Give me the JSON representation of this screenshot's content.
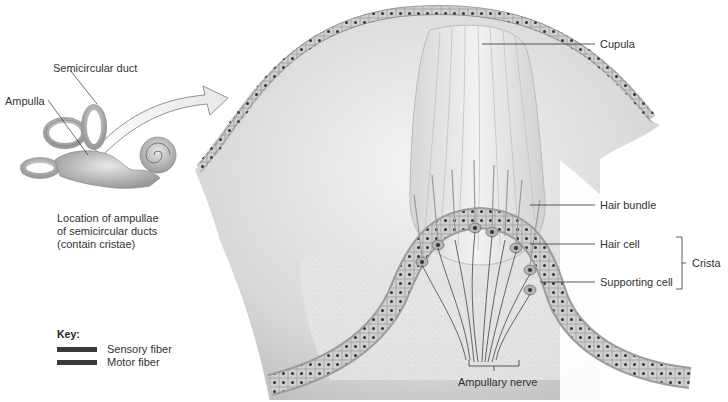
{
  "figure": {
    "inset": {
      "labels": {
        "semicircular_duct": "Semicircular duct",
        "ampulla": "Ampulla"
      },
      "caption_lines": [
        "Location of ampullae",
        "of semicircular ducts",
        "(contain cristae)"
      ]
    },
    "main": {
      "labels": {
        "cupula": "Cupula",
        "hair_bundle": "Hair bundle",
        "hair_cell": "Hair cell",
        "supporting_cell": "Supporting cell",
        "crista": "Crista",
        "ampullary_nerve": "Ampullary nerve"
      }
    },
    "key": {
      "title": "Key:",
      "items": [
        {
          "label": "Sensory fiber",
          "color": "#3a3a3a"
        },
        {
          "label": "Motor fiber",
          "color": "#3a3a3a"
        }
      ]
    }
  }
}
